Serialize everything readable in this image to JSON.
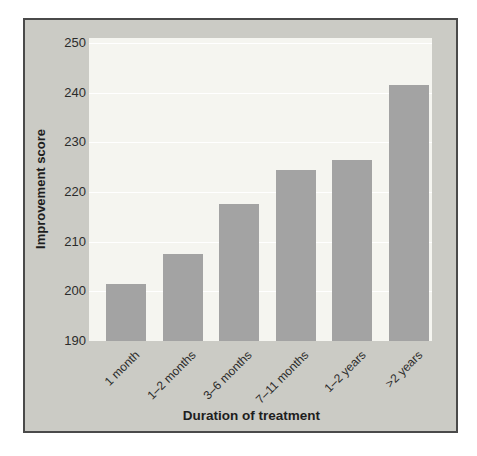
{
  "figure": {
    "background_color": "#ffffff",
    "panel_background_color": "#cbcbc5",
    "panel_border_color": "#4a4a4a",
    "plot_background_color": "#f5f5f0",
    "gridline_color": "#ffffff",
    "bar_color": "#a3a3a3",
    "text_color": "#2b2b2b"
  },
  "chart_data": {
    "type": "bar",
    "categories": [
      "1 month",
      "1–2 months",
      "3–6 months",
      "7–11 months",
      "1–2 years",
      ">2 years"
    ],
    "values": [
      201.5,
      207.5,
      217.5,
      224.5,
      226.5,
      241.5
    ],
    "title": "",
    "xlabel": "Duration of treatment",
    "ylabel": "Improvement score",
    "ylim": [
      190,
      251
    ],
    "yticks": [
      190,
      200,
      210,
      220,
      230,
      240,
      250
    ],
    "grid": "horizontal",
    "legend": "none"
  }
}
